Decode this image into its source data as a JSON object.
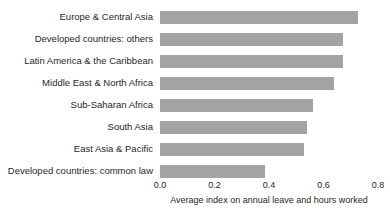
{
  "chart_data": {
    "type": "bar",
    "orientation": "horizontal",
    "title": "",
    "subtitle": "",
    "xlabel": "Average index on annual leave and hours worked",
    "ylabel": "",
    "xlim": [
      0.0,
      0.8
    ],
    "xticks": [
      "0.0",
      "0.2",
      "0.4",
      "0.6",
      "0.8"
    ],
    "xtick_values": [
      0.0,
      0.2,
      0.4,
      0.6,
      0.8
    ],
    "grid": false,
    "legend": null,
    "bar_color": "#a3a3a3",
    "background_color": "#ffffff",
    "categories": [
      "Europe & Central Asia",
      "Developed countries: others",
      "Latin America & the Caribbean",
      "Middle East & North Africa",
      "Sub-Saharan Africa",
      "South Asia",
      "East Asia & Pacific",
      "Developed countries: common law"
    ],
    "values": [
      0.725,
      0.67,
      0.67,
      0.64,
      0.56,
      0.54,
      0.53,
      0.385
    ]
  }
}
